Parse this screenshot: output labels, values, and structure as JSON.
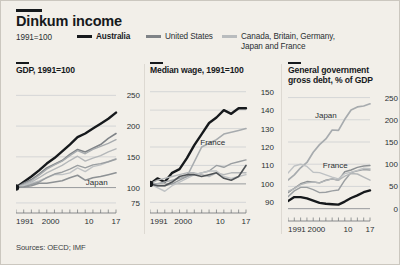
{
  "header": {
    "title": "Dinkum income",
    "subnote": "1991=100",
    "legend": [
      {
        "label": "Australia",
        "color": "#16191c",
        "name": "legend-australia"
      },
      {
        "label": "United States",
        "color": "#7f8387",
        "name": "legend-united-states"
      },
      {
        "label": "Canada, Britain, Germany,",
        "label2": "Japan and France",
        "color": "#b9bcbe",
        "name": "legend-other-countries"
      }
    ]
  },
  "sources": "Sources: OECD; IMF",
  "chart_data": [
    {
      "type": "line",
      "name": "panel-gdp",
      "title": "GDP, 1991=100",
      "xlabel": "",
      "ylabel": "",
      "grid": true,
      "legend_position": "top",
      "x": [
        1991,
        1993,
        1995,
        1997,
        1999,
        2001,
        2003,
        2005,
        2007,
        2009,
        2011,
        2013,
        2015,
        2017
      ],
      "xticks": [
        1991,
        2000,
        10,
        17
      ],
      "xtick_labels": [
        "1991",
        "2000",
        "10",
        "17"
      ],
      "yticks": [
        75,
        100,
        150,
        200,
        250
      ],
      "ytick_labels": [
        "75",
        "100",
        "150",
        "200",
        "250"
      ],
      "ylim": [
        70,
        262
      ],
      "xlim": [
        1991,
        2017
      ],
      "annotations": [
        {
          "text": "Japan",
          "x": 2012,
          "y": 104
        }
      ],
      "series": [
        {
          "name": "Australia",
          "color": "#16191c",
          "width": 2.4,
          "values": [
            100,
            109,
            118,
            128,
            139,
            148,
            159,
            170,
            182,
            188,
            196,
            204,
            212,
            222
          ]
        },
        {
          "name": "United States",
          "color": "#7f8387",
          "width": 1.6,
          "values": [
            100,
            107,
            113,
            122,
            132,
            138,
            144,
            154,
            162,
            158,
            164,
            170,
            180,
            188
          ]
        },
        {
          "name": "Canada",
          "color": "#a7abae",
          "width": 1.4,
          "values": [
            100,
            105,
            111,
            120,
            130,
            137,
            143,
            152,
            160,
            155,
            162,
            167,
            172,
            178
          ]
        },
        {
          "name": "Britain",
          "color": "#b4b7b9",
          "width": 1.4,
          "values": [
            100,
            104,
            109,
            116,
            124,
            130,
            136,
            144,
            151,
            143,
            148,
            152,
            158,
            163
          ]
        },
        {
          "name": "Germany",
          "color": "#bfc2c4",
          "width": 1.4,
          "values": [
            100,
            103,
            107,
            111,
            116,
            121,
            121,
            124,
            132,
            126,
            134,
            137,
            142,
            147
          ]
        },
        {
          "name": "France",
          "color": "#9a9ea1",
          "width": 1.4,
          "values": [
            100,
            101,
            105,
            109,
            116,
            122,
            125,
            130,
            136,
            132,
            137,
            139,
            142,
            146
          ]
        },
        {
          "name": "Japan",
          "color": "#8d9194",
          "width": 1.6,
          "values": [
            100,
            101,
            103,
            107,
            107,
            109,
            111,
            116,
            120,
            112,
            116,
            118,
            121,
            124
          ]
        }
      ]
    },
    {
      "type": "line",
      "name": "panel-median-wage",
      "title": "Median wage, 1991=100",
      "xlabel": "",
      "ylabel": "",
      "grid": true,
      "x": [
        1991,
        1993,
        1995,
        1997,
        1999,
        2001,
        2003,
        2005,
        2007,
        2009,
        2011,
        2013,
        2015,
        2017
      ],
      "xticks": [
        1991,
        2000,
        10,
        17
      ],
      "xtick_labels": [
        "1991",
        "2000",
        "10",
        "17"
      ],
      "yticks": [
        90,
        100,
        110,
        120,
        130,
        140,
        150
      ],
      "ytick_labels": [
        "90",
        "100",
        "110",
        "120",
        "130",
        "140",
        "150"
      ],
      "ylim": [
        88,
        152
      ],
      "xlim": [
        1991,
        2017
      ],
      "annotations": [
        {
          "text": "France",
          "x": 2008,
          "y": 121
        }
      ],
      "series": [
        {
          "name": "Australia",
          "color": "#16191c",
          "width": 2.4,
          "values": [
            100,
            103,
            101,
            106,
            108,
            114,
            121,
            127,
            133,
            136,
            140,
            138,
            141,
            141
          ]
        },
        {
          "name": "France",
          "color": "#a7abae",
          "width": 1.6,
          "values": [
            100,
            100,
            101,
            102,
            103,
            104,
            112,
            120,
            122,
            124,
            127,
            128,
            129,
            130
          ]
        },
        {
          "name": "Canada",
          "color": "#9a9ea1",
          "width": 1.4,
          "values": [
            100,
            99,
            99,
            100,
            102,
            104,
            105,
            106,
            107,
            110,
            109,
            111,
            112,
            113
          ]
        },
        {
          "name": "Germany",
          "color": "#b4b7b9",
          "width": 1.4,
          "values": [
            100,
            102,
            103,
            104,
            105,
            106,
            106,
            105,
            104,
            106,
            105,
            106,
            106,
            106
          ]
        },
        {
          "name": "Britain",
          "color": "#bfc2c4",
          "width": 1.4,
          "values": [
            100,
            98,
            96,
            99,
            101,
            103,
            105,
            106,
            107,
            107,
            104,
            103,
            104,
            105
          ]
        },
        {
          "name": "United States",
          "color": "#4e5256",
          "width": 1.6,
          "values": [
            100,
            99,
            99,
            101,
            104,
            105,
            105,
            104,
            105,
            106,
            103,
            102,
            104,
            110
          ]
        }
      ]
    },
    {
      "type": "line",
      "name": "panel-government-debt",
      "title": "General government gross debt, % of GDP",
      "title_line1": "General government",
      "title_line2": "gross debt, % of GDP",
      "xlabel": "",
      "ylabel": "",
      "grid": true,
      "x": [
        1991,
        1993,
        1995,
        1997,
        1999,
        2001,
        2003,
        2005,
        2007,
        2009,
        2011,
        2013,
        2015,
        2017
      ],
      "xticks": [
        1991,
        2000,
        10,
        17
      ],
      "xtick_labels": [
        "1991",
        "2000",
        "10",
        "17"
      ],
      "yticks": [
        0,
        50,
        100,
        150,
        200,
        250
      ],
      "ytick_labels": [
        "0",
        "50",
        "100",
        "150",
        "200",
        "250"
      ],
      "ylim": [
        -12,
        258
      ],
      "xlim": [
        1991,
        2017
      ],
      "annotations": [
        {
          "text": "Japan",
          "x": 2003,
          "y": 205
        },
        {
          "text": "France",
          "x": 2006,
          "y": 92
        }
      ],
      "series": [
        {
          "name": "Japan",
          "color": "#a7abae",
          "width": 1.7,
          "values": [
            64,
            76,
            92,
            104,
            127,
            144,
            157,
            177,
            176,
            201,
            222,
            229,
            231,
            236
          ]
        },
        {
          "name": "Britain",
          "color": "#9a9ea1",
          "width": 1.4,
          "values": [
            27,
            40,
            48,
            48,
            43,
            36,
            37,
            40,
            42,
            64,
            81,
            85,
            88,
            87
          ]
        },
        {
          "name": "France",
          "color": "#8d9194",
          "width": 1.4,
          "values": [
            36,
            46,
            56,
            61,
            60,
            58,
            64,
            67,
            64,
            83,
            87,
            93,
            96,
            97
          ]
        },
        {
          "name": "Germany",
          "color": "#b4b7b9",
          "width": 1.4,
          "values": [
            39,
            45,
            54,
            58,
            60,
            58,
            63,
            67,
            64,
            73,
            79,
            78,
            71,
            64
          ]
        },
        {
          "name": "Canada",
          "color": "#bfc2c4",
          "width": 1.4,
          "values": [
            80,
            96,
            100,
            95,
            82,
            81,
            76,
            71,
            67,
            79,
            82,
            86,
            91,
            90
          ]
        },
        {
          "name": "Australia",
          "color": "#16191c",
          "width": 2.4,
          "values": [
            17,
            26,
            26,
            23,
            18,
            13,
            11,
            10,
            9,
            16,
            24,
            30,
            37,
            41
          ]
        }
      ]
    }
  ]
}
